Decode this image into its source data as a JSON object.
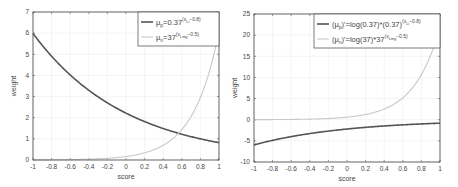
{
  "chart_data": [
    {
      "type": "line",
      "title": "",
      "xlabel": "score",
      "ylabel": "weight",
      "xlim": [
        -1,
        1
      ],
      "ylim": [
        0,
        7
      ],
      "xticks": [
        "-1",
        "-0.8",
        "-0.6",
        "-0.4",
        "-0.2",
        "0",
        "0.2",
        "0.4",
        "0.6",
        "0.8",
        "1"
      ],
      "yticks": [
        "0",
        "1",
        "2",
        "3",
        "4",
        "5",
        "6",
        "7"
      ],
      "grid": true,
      "legend_position": "upper right",
      "x": [
        -1,
        -0.8,
        -0.6,
        -0.4,
        -0.2,
        0,
        0.2,
        0.4,
        0.6,
        0.8,
        1
      ],
      "series": [
        {
          "name": "μp=0.37^(xLi−0.8)",
          "legend_main": "μ",
          "legend_sub": "p",
          "legend_rest": "=0.37",
          "legend_sup": "(x",
          "legend_supsub": "Li",
          "legend_sup2": "−0.8)",
          "color": "#555555",
          "values": [
            5.99,
            4.83,
            3.89,
            3.13,
            2.52,
            2.22,
            1.64,
            1.32,
            1.22,
            0.98,
            0.82
          ]
        },
        {
          "name": "μn=37^(xLmg−0.5)",
          "legend_main": "μ",
          "legend_sub": "n",
          "legend_rest": "=37",
          "legend_sup": "(x",
          "legend_supsub": "Lmg",
          "legend_sup2": "−0.5)",
          "color": "#c8c8c8",
          "values": [
            0.004,
            0.008,
            0.015,
            0.029,
            0.06,
            0.16,
            0.32,
            0.59,
            1.2,
            2.4,
            6.08
          ]
        }
      ]
    },
    {
      "type": "line",
      "title": "",
      "xlabel": "score",
      "ylabel": "weight",
      "xlim": [
        -1,
        1
      ],
      "ylim": [
        -10,
        25
      ],
      "xticks": [
        "-1",
        "-0.8",
        "-0.6",
        "-0.4",
        "-0.2",
        "0",
        "0.2",
        "0.4",
        "0.6",
        "0.8",
        "1"
      ],
      "yticks": [
        "-10",
        "-5",
        "0",
        "5",
        "10",
        "15",
        "20",
        "25"
      ],
      "grid": true,
      "legend_position": "upper right",
      "x": [
        -1,
        -0.8,
        -0.6,
        -0.4,
        -0.2,
        0,
        0.2,
        0.4,
        0.6,
        0.8,
        1
      ],
      "series": [
        {
          "name": "(μp)'=log(0.37)*(0.37)^(xLi−0.8)",
          "legend_main": "(μ",
          "legend_sub": "p",
          "legend_rest": ")'=log(0.37)*(0.37)",
          "legend_sup": "(x",
          "legend_supsub": "Li",
          "legend_sup2": "−0.8)",
          "color": "#555555",
          "values": [
            -5.96,
            -4.8,
            -3.87,
            -3.11,
            -2.51,
            -2.2,
            -1.63,
            -1.31,
            -1.06,
            -0.86,
            -0.82
          ]
        },
        {
          "name": "(μn)'=log(37)*37^(xLmg−0.5)",
          "legend_main": "(μ",
          "legend_sub": "n",
          "legend_rest": ")'=log(37)*37",
          "legend_sup": "(x",
          "legend_supsub": "Lmg",
          "legend_sup2": "−0.5)",
          "color": "#c8c8c8",
          "values": [
            0.016,
            0.03,
            0.06,
            0.1,
            0.21,
            0.59,
            1.16,
            2.13,
            4.3,
            8.7,
            21.0
          ]
        }
      ]
    }
  ]
}
